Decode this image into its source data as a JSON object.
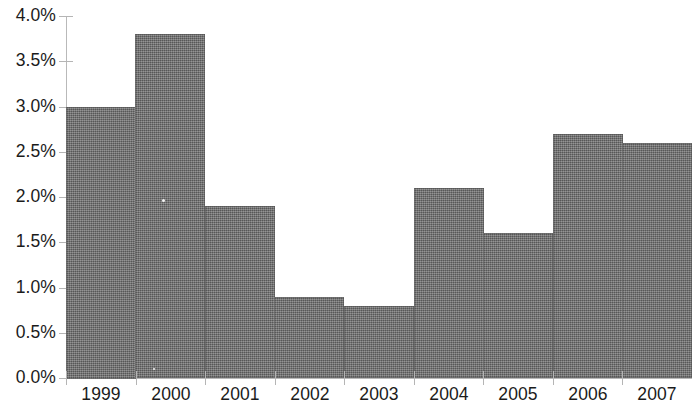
{
  "chart_data": {
    "type": "bar",
    "title": "",
    "subtitle": "",
    "xlabel": "",
    "ylabel": "",
    "categories": [
      "1999",
      "2000",
      "2001",
      "2002",
      "2003",
      "2004",
      "2005",
      "2006",
      "2007"
    ],
    "values": [
      3.0,
      3.8,
      1.9,
      0.9,
      0.8,
      2.1,
      1.6,
      2.7,
      2.6
    ],
    "value_labels": [
      "3.0%",
      "3.8%",
      "1.9%",
      "0.9%",
      "0.8%",
      "2.1%",
      "1.6%",
      "2.7%",
      "2.6%"
    ],
    "ylim": [
      0.0,
      4.0
    ],
    "ytick_values": [
      0.0,
      0.5,
      1.0,
      1.5,
      2.0,
      2.5,
      3.0,
      3.5,
      4.0
    ],
    "ytick_labels": [
      "0.0%",
      "0.5%",
      "1.0%",
      "1.5%",
      "2.0%",
      "2.5%",
      "3.0%",
      "3.5%",
      "4.0%"
    ],
    "grid": false,
    "legend": false,
    "legend_position": "none",
    "unit": "percent",
    "series": [
      {
        "name": "",
        "values": [
          3.0,
          3.8,
          1.9,
          0.9,
          0.8,
          2.1,
          1.6,
          2.7,
          2.6
        ]
      }
    ],
    "colors": {
      "bar_fill": "#6b6b6b",
      "axis": "#b9b9b9",
      "tick": "#b5b5b5",
      "text": "#1b1b1b",
      "background": "#ffffff"
    }
  }
}
